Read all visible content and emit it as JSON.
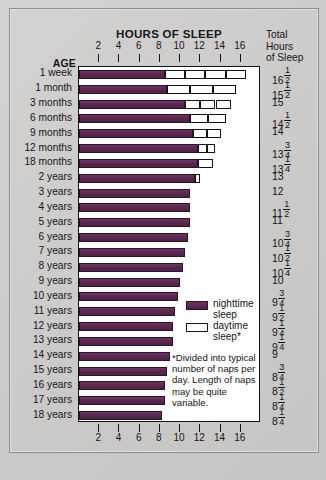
{
  "chart_data": {
    "type": "bar",
    "title": "HOURS OF SLEEP",
    "xlabel": "",
    "ylabel": "AGE",
    "xlim": [
      0,
      18
    ],
    "grid": false,
    "orientation": "horizontal",
    "stacked": true,
    "legend_position": "inside-right",
    "xticks": [
      2,
      4,
      6,
      8,
      10,
      12,
      14,
      16
    ],
    "xticklabels": [
      "2",
      "4",
      "6",
      "8",
      "10",
      "12",
      "14",
      "16"
    ],
    "categories": [
      "1 week",
      "1 month",
      "3 months",
      "6 months",
      "9 months",
      "12 months",
      "18 months",
      "2 years",
      "3 years",
      "4 years",
      "5 years",
      "6 years",
      "7 years",
      "8 years",
      "9 years",
      "10 years",
      "11 years",
      "12 years",
      "13 years",
      "14 years",
      "15 years",
      "16 years",
      "17 years",
      "18 years"
    ],
    "series": [
      {
        "name": "nighttime sleep",
        "color": "#5b2a51",
        "values": [
          8.5,
          8.75,
          10.5,
          11,
          11.25,
          11.75,
          11.75,
          11.5,
          11,
          11,
          11,
          10.75,
          10.5,
          10.25,
          10,
          9.75,
          9.5,
          9.25,
          9.25,
          9,
          8.75,
          8.5,
          8.5,
          8.25
        ]
      },
      {
        "name": "daytime sleep",
        "color": "#ffffff",
        "naps": [
          4,
          3,
          3,
          2,
          2,
          2,
          1,
          1,
          0,
          0,
          0,
          0,
          0,
          0,
          0,
          0,
          0,
          0,
          0,
          0,
          0,
          0,
          0,
          0
        ],
        "values": [
          8,
          6.75,
          4.5,
          3.5,
          2.75,
          1.75,
          1.5,
          0.5,
          0,
          0,
          0,
          0,
          0,
          0,
          0,
          0,
          0,
          0,
          0,
          0,
          0,
          0,
          0,
          0
        ]
      }
    ],
    "totals": [
      {
        "whole": "16",
        "num": "1",
        "den": "2"
      },
      {
        "whole": "15",
        "num": "1",
        "den": "2"
      },
      {
        "whole": "15",
        "num": "",
        "den": ""
      },
      {
        "whole": "14",
        "num": "1",
        "den": "2"
      },
      {
        "whole": "14",
        "num": "",
        "den": ""
      },
      {
        "whole": "13",
        "num": "3",
        "den": "4"
      },
      {
        "whole": "13",
        "num": "1",
        "den": "4"
      },
      {
        "whole": "13",
        "num": "",
        "den": ""
      },
      {
        "whole": "12",
        "num": "",
        "den": ""
      },
      {
        "whole": "11",
        "num": "1",
        "den": "2"
      },
      {
        "whole": "11",
        "num": "",
        "den": ""
      },
      {
        "whole": "10",
        "num": "3",
        "den": "4"
      },
      {
        "whole": "10",
        "num": "1",
        "den": "2"
      },
      {
        "whole": "10",
        "num": "1",
        "den": "4"
      },
      {
        "whole": "10",
        "num": "",
        "den": ""
      },
      {
        "whole": "9",
        "num": "3",
        "den": "4"
      },
      {
        "whole": "9",
        "num": "1",
        "den": "2"
      },
      {
        "whole": "9",
        "num": "1",
        "den": "4"
      },
      {
        "whole": "9",
        "num": "1",
        "den": "4"
      },
      {
        "whole": "9",
        "num": "",
        "den": ""
      },
      {
        "whole": "8",
        "num": "3",
        "den": "4"
      },
      {
        "whole": "8",
        "num": "1",
        "den": "2"
      },
      {
        "whole": "8",
        "num": "1",
        "den": "4"
      },
      {
        "whole": "8",
        "num": "1",
        "den": "4"
      }
    ]
  },
  "header": {
    "chart_title": "HOURS OF SLEEP",
    "age_header": "AGE",
    "totals_header_line1": "Total",
    "totals_header_line2": "Hours",
    "totals_header_line3": "of Sleep"
  },
  "legend": {
    "night_label_line1": "nighttime",
    "night_label_line2": "sleep",
    "day_label_line1": "daytime",
    "day_label_line2": "sleep*",
    "night_swatch": "night-swatch",
    "day_swatch": "day-swatch"
  },
  "footnote": {
    "text": "*Divided into typical number of naps per day. Length of naps may be quite variable."
  },
  "colors": {
    "night": "#5b2a51",
    "day": "#ffffff",
    "background": "#cbcac8",
    "ink": "#16151a"
  }
}
